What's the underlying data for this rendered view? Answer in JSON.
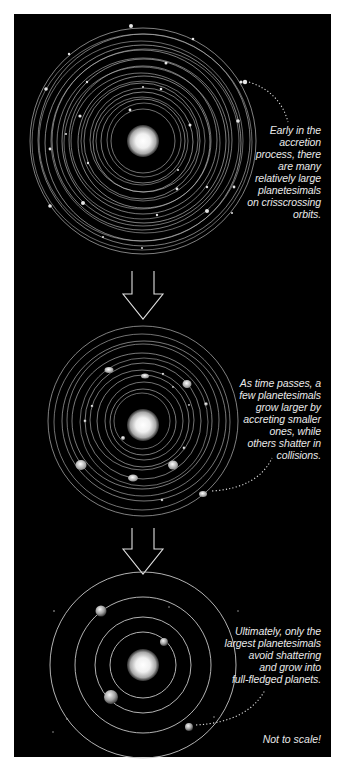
{
  "figure": {
    "background_color": "#000000",
    "frame_color": "#ffffff",
    "orbit_color": "#cfcfcf",
    "stages": [
      {
        "id": "stage-1",
        "caption": "Early in the\naccretion\nprocess, there\nare many\nrelatively large\nplanetesimals\non crisscrossing\norbits."
      },
      {
        "id": "stage-2",
        "caption": "As time passes, a\nfew planetesimals\ngrow larger by\naccreting smaller\nones, while\nothers shatter in\ncollisions."
      },
      {
        "id": "stage-3",
        "caption": "Ultimately, only the\nlargest planetesimals\navoid shattering\nand grow into\nfull-fledged planets."
      }
    ],
    "note": "Not to scale!"
  }
}
